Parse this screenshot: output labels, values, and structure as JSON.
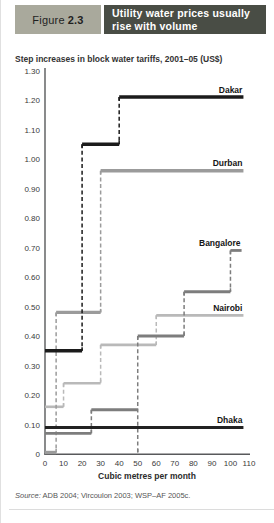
{
  "header": {
    "figure_word": "Figure",
    "figure_number": "2.3",
    "title_line1": "Utility water prices usually",
    "title_line2": "rise with volume"
  },
  "subtitle": "Step increases in block water tariffs, 2001–05 (US$)",
  "source": {
    "label": "Source:",
    "text": " ADB 2004; Vircoulon 2003; WSP–AF 2005c."
  },
  "colors": {
    "figlabel_bg": "#a9a99c",
    "titlebar_bg": "#494d45",
    "axis": "#58595b",
    "tick_text": "#3a3a3a",
    "label_text": "#151515"
  },
  "chart_data": {
    "type": "line",
    "style": "step-blocks",
    "title": "Step increases in block water tariffs, 2001–05 (US$)",
    "xlabel": "Cubic metres per month",
    "ylabel": "",
    "xlim": [
      0,
      110
    ],
    "ylim": [
      0,
      1.3
    ],
    "grid": false,
    "x_ticks": [
      0,
      10,
      20,
      30,
      40,
      50,
      60,
      70,
      80,
      90,
      100,
      110
    ],
    "y_ticks": [
      "1.30",
      "1.20",
      "1.10",
      "1.00",
      "0.90",
      "0.80",
      "0.70",
      "0.60",
      "0.50",
      "0.40",
      "0.30",
      "0.20",
      "0.10",
      "0"
    ],
    "series": [
      {
        "name": "Nairobi",
        "color": "#b9b9b9",
        "width": 2.6,
        "blocks": [
          {
            "x0": 0,
            "x1": 10,
            "y": 0.16
          },
          {
            "x0": 10,
            "x1": 30,
            "y": 0.24
          },
          {
            "x0": 30,
            "x1": 60,
            "y": 0.37
          },
          {
            "x0": 60,
            "x1": 107,
            "y": 0.47
          }
        ]
      },
      {
        "name": "Durban",
        "color": "#9b9b9b",
        "width": 3.4,
        "blocks": [
          {
            "x0": 0,
            "x1": 6,
            "y": 0.0
          },
          {
            "x0": 6,
            "x1": 30,
            "y": 0.48
          },
          {
            "x0": 30,
            "x1": 107,
            "y": 0.96
          }
        ]
      },
      {
        "name": "Bangalore",
        "color": "#7d7d7d",
        "width": 2.8,
        "connector_to_axis": [
          50
        ],
        "blocks": [
          {
            "x0": 0,
            "x1": 25,
            "y": 0.07
          },
          {
            "x0": 25,
            "x1": 50,
            "y": 0.15
          },
          {
            "x0": 50,
            "x1": 75,
            "y": 0.4
          },
          {
            "x0": 75,
            "x1": 100,
            "y": 0.55
          },
          {
            "x0": 100,
            "x1": 106,
            "y": 0.69
          }
        ]
      },
      {
        "name": "Dakar",
        "color": "#1b1b1b",
        "width": 3.4,
        "blocks": [
          {
            "x0": 0,
            "x1": 20,
            "y": 0.35
          },
          {
            "x0": 20,
            "x1": 40,
            "y": 1.05
          },
          {
            "x0": 40,
            "x1": 107,
            "y": 1.21
          }
        ]
      },
      {
        "name": "Dhaka",
        "color": "#222222",
        "width": 3.0,
        "blocks": [
          {
            "x0": 0,
            "x1": 107,
            "y": 0.09
          }
        ]
      }
    ]
  }
}
